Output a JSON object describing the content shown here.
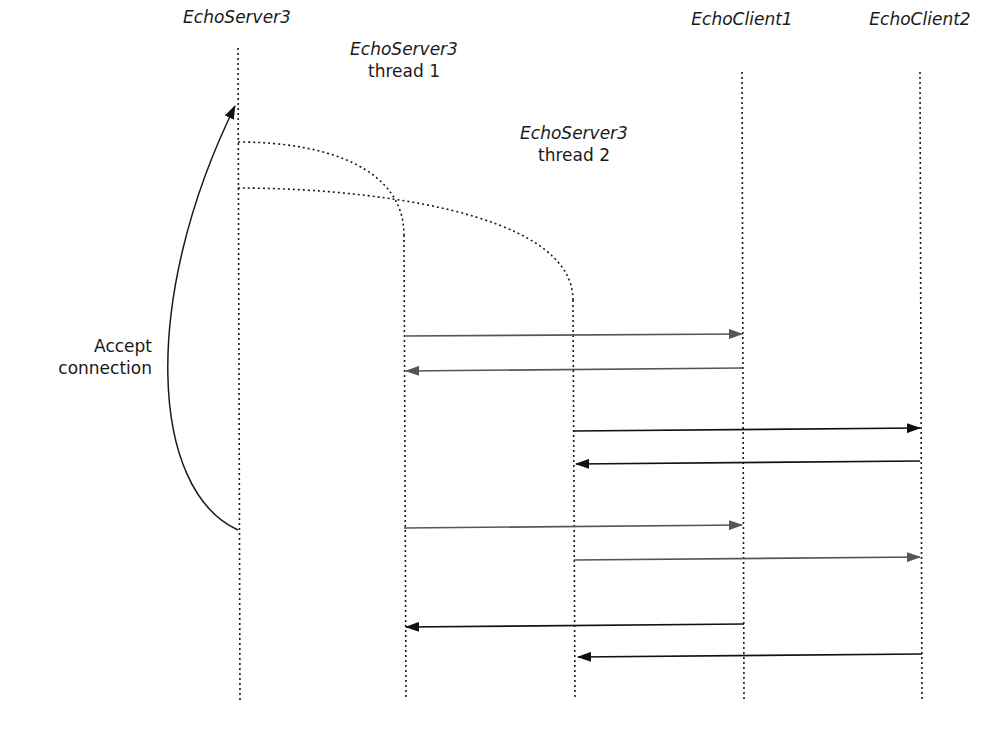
{
  "diagram": {
    "type": "sequence",
    "lifelines": [
      {
        "id": "server",
        "name": "EchoServer3",
        "subtitle": "",
        "x": 238,
        "y_top": 75,
        "y_bottom": 700
      },
      {
        "id": "thread1",
        "name": "EchoServer3",
        "subtitle": "thread 1",
        "x": 404,
        "y_top": 235,
        "y_bottom": 700
      },
      {
        "id": "thread2",
        "name": "EchoServer3",
        "subtitle": "thread 2",
        "x": 573,
        "y_top": 300,
        "y_bottom": 700
      },
      {
        "id": "client1",
        "name": "EchoClient1",
        "subtitle": "",
        "x": 744,
        "y_top": 72,
        "y_bottom": 700
      },
      {
        "id": "client2",
        "name": "EchoClient2",
        "subtitle": "",
        "x": 921,
        "y_top": 72,
        "y_bottom": 700
      }
    ],
    "annotation": {
      "line1": "Accept",
      "line2": "connection"
    },
    "spawns": [
      {
        "from": "server",
        "to": "thread1",
        "y": 143
      },
      {
        "from": "server",
        "to": "thread2",
        "y": 188
      }
    ],
    "messages": [
      {
        "from": "thread1",
        "to": "client1",
        "y": 335,
        "style": "gray"
      },
      {
        "from": "client1",
        "to": "thread1",
        "y": 370,
        "style": "gray"
      },
      {
        "from": "thread2",
        "to": "client2",
        "y": 430,
        "style": "black"
      },
      {
        "from": "client2",
        "to": "thread2",
        "y": 463,
        "style": "black"
      },
      {
        "from": "thread1",
        "to": "client1",
        "y": 527,
        "style": "gray"
      },
      {
        "from": "thread2",
        "to": "client2",
        "y": 558,
        "style": "gray"
      },
      {
        "from": "client1",
        "to": "thread1",
        "y": 625,
        "style": "black"
      },
      {
        "from": "client2",
        "to": "thread2",
        "y": 656,
        "style": "black"
      }
    ]
  },
  "labels": {
    "server": "EchoServer3",
    "thread1_name": "EchoServer3",
    "thread1_sub": "thread 1",
    "thread2_name": "EchoServer3",
    "thread2_sub": "thread 2",
    "client1": "EchoClient1",
    "client2": "EchoClient2",
    "accept_line1": "Accept",
    "accept_line2": "connection"
  },
  "colors": {
    "line": "#1a1a1a",
    "gray_arrow": "#555555",
    "black_arrow": "#111111"
  }
}
